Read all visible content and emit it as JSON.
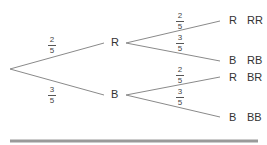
{
  "diagram": {
    "type": "probability-tree",
    "first_stage": [
      {
        "label": "R",
        "prob_num": "2",
        "prob_den": "5"
      },
      {
        "label": "B",
        "prob_num": "3",
        "prob_den": "5"
      }
    ],
    "second_stage": [
      {
        "label": "R",
        "prob_num": "2",
        "prob_den": "5",
        "outcome": "RR"
      },
      {
        "label": "B",
        "prob_num": "3",
        "prob_den": "5",
        "outcome": "RB"
      },
      {
        "label": "R",
        "prob_num": "2",
        "prob_den": "5",
        "outcome": "BR"
      },
      {
        "label": "B",
        "prob_num": "3",
        "prob_den": "5",
        "outcome": "BB"
      }
    ],
    "line_color": "#888888",
    "rule_color": "#999999"
  }
}
